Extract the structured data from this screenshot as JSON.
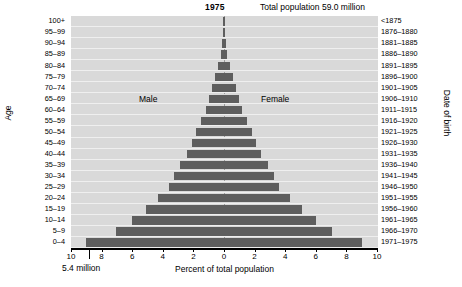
{
  "header": {
    "year": "1975",
    "total_population": "Total population 59.0 million"
  },
  "axes": {
    "y_left_title": "Age",
    "y_right_title": "Date of birth",
    "x_title": "Percent of total population",
    "scale_note": "5.4 million"
  },
  "legend": {
    "male": "Male",
    "female": "Female"
  },
  "xticks": [
    "10",
    "8",
    "6",
    "4",
    "2",
    "0",
    "2",
    "4",
    "6",
    "8",
    "10"
  ],
  "chart_data": {
    "type": "bar",
    "title": "1975",
    "subtitle": "Total population 59.0 million",
    "xlabel": "Percent of total population",
    "ylabel": "Age",
    "y2label": "Date of birth",
    "xlim": [
      -10,
      10
    ],
    "xtick_values": [
      -10,
      -8,
      -6,
      -4,
      -2,
      0,
      2,
      4,
      6,
      8,
      10
    ],
    "xtick_labels": [
      "10",
      "8",
      "6",
      "4",
      "2",
      "0",
      "2",
      "4",
      "6",
      "8",
      "10"
    ],
    "grid": true,
    "legend_position": "inside",
    "annotations": [
      "5.4 million"
    ],
    "categories": [
      "100+",
      "95–99",
      "90–94",
      "85–89",
      "80–84",
      "75–79",
      "70–74",
      "65–69",
      "60–64",
      "55–59",
      "50–54",
      "45–49",
      "40–44",
      "35–39",
      "30–34",
      "25–29",
      "20–24",
      "15–19",
      "10–14",
      "5–9",
      "0–4"
    ],
    "date_of_birth": [
      "<1875",
      "1876–1880",
      "1881–1885",
      "1886–1890",
      "1891–1895",
      "1896–1900",
      "1901–1905",
      "1906–1910",
      "1911–1915",
      "1916–1920",
      "1921–1925",
      "1926–1930",
      "1931–1935",
      "1936–1940",
      "1941–1945",
      "1946–1950",
      "1951–1955",
      "1956–1960",
      "1961–1965",
      "1966–1970",
      "1971–1975"
    ],
    "series": [
      {
        "name": "Male",
        "side": "left",
        "values": [
          0.02,
          0.05,
          0.12,
          0.22,
          0.38,
          0.56,
          0.76,
          0.97,
          1.2,
          1.5,
          1.8,
          2.1,
          2.4,
          2.9,
          3.25,
          3.6,
          4.3,
          5.1,
          6.0,
          7.05,
          9.0
        ]
      },
      {
        "name": "Female",
        "side": "right",
        "values": [
          0.02,
          0.05,
          0.12,
          0.22,
          0.38,
          0.56,
          0.76,
          0.97,
          1.2,
          1.5,
          1.8,
          2.1,
          2.4,
          2.9,
          3.25,
          3.6,
          4.3,
          5.1,
          6.0,
          7.05,
          9.0
        ]
      }
    ],
    "colors": {
      "bar": "#5e5e5e",
      "plot_background": "#d9d9d9",
      "gridline": "#efefef",
      "axis": "#000000"
    }
  }
}
